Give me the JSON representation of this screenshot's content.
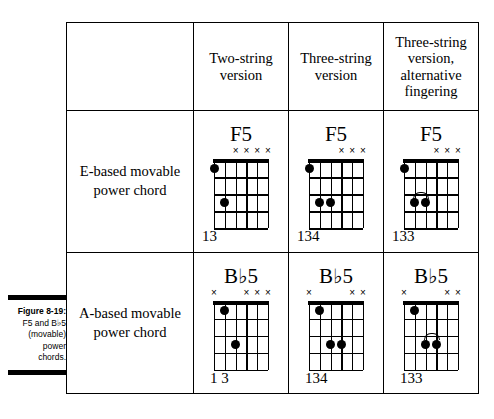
{
  "caption": {
    "title": "Figure 8-19:",
    "line1_pre": "F5 and B",
    "line1_flat": "♭",
    "line1_post": "5",
    "line2": "(movable)",
    "line3": "power",
    "line4": "chords."
  },
  "table": {
    "corner_label": "",
    "column_headers": [
      "Two-string version",
      "Three-string version",
      "Three-string version, alternative fingering"
    ],
    "rows": [
      {
        "label": "E-based movable power chord",
        "cells": [
          {
            "chord_name_base": "F",
            "chord_name_flat": "",
            "chord_name_suffix": "5",
            "fingers": "13",
            "fingers_indent": "0px",
            "muted_strings": [
              4,
              3,
              2,
              1
            ],
            "dots": [
              {
                "string": 6,
                "fret": 1
              },
              {
                "string": 5,
                "fret": 3
              }
            ],
            "barre": null
          },
          {
            "chord_name_base": "F",
            "chord_name_flat": "",
            "chord_name_suffix": "5",
            "fingers": "134",
            "fingers_indent": "0px",
            "muted_strings": [
              3,
              2,
              1
            ],
            "dots": [
              {
                "string": 6,
                "fret": 1
              },
              {
                "string": 5,
                "fret": 3
              },
              {
                "string": 4,
                "fret": 3
              }
            ],
            "barre": null
          },
          {
            "chord_name_base": "F",
            "chord_name_flat": "",
            "chord_name_suffix": "5",
            "fingers": "133",
            "fingers_indent": "0px",
            "muted_strings": [
              3,
              2,
              1
            ],
            "dots": [
              {
                "string": 6,
                "fret": 1
              },
              {
                "string": 5,
                "fret": 3
              },
              {
                "string": 4,
                "fret": 3
              }
            ],
            "barre": {
              "string_from": 5,
              "string_to": 4,
              "fret": 3
            }
          }
        ]
      },
      {
        "label": "A-based movable power chord",
        "cells": [
          {
            "chord_name_base": "B",
            "chord_name_flat": "♭",
            "chord_name_suffix": "5",
            "fingers": "1 3",
            "fingers_indent": "8px",
            "muted_strings": [
              6,
              3,
              2,
              1
            ],
            "dots": [
              {
                "string": 5,
                "fret": 1
              },
              {
                "string": 4,
                "fret": 3
              }
            ],
            "barre": null
          },
          {
            "chord_name_base": "B",
            "chord_name_flat": "♭",
            "chord_name_suffix": "5",
            "fingers": "134",
            "fingers_indent": "8px",
            "muted_strings": [
              6,
              2,
              1
            ],
            "dots": [
              {
                "string": 5,
                "fret": 1
              },
              {
                "string": 4,
                "fret": 3
              },
              {
                "string": 3,
                "fret": 3
              }
            ],
            "barre": null
          },
          {
            "chord_name_base": "B",
            "chord_name_flat": "♭",
            "chord_name_suffix": "5",
            "fingers": "133",
            "fingers_indent": "8px",
            "muted_strings": [
              6,
              2,
              1
            ],
            "dots": [
              {
                "string": 5,
                "fret": 1
              },
              {
                "string": 4,
                "fret": 3
              },
              {
                "string": 3,
                "fret": 3
              }
            ],
            "barre": {
              "string_from": 4,
              "string_to": 3,
              "fret": 3
            }
          }
        ]
      }
    ]
  },
  "diagram_spec": {
    "string_count": 6,
    "fret_count": 4,
    "mute_glyph": "×"
  },
  "colors": {
    "ink": "#000000",
    "paper": "#ffffff"
  }
}
